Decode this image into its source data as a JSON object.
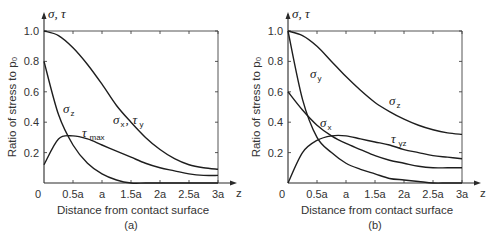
{
  "chart_data": [
    {
      "type": "line",
      "panel_label": "(a)",
      "title": "",
      "xlabel": "Distance from contact surface",
      "ylabel": "Ratio of stress to p₀",
      "y_axis_symbol": "σ, τ",
      "x_axis_symbol": "z",
      "xlim": [
        0,
        3
      ],
      "ylim": [
        0,
        1.0
      ],
      "x_tick_labels": [
        "0",
        "0.5a",
        "a",
        "1.5a",
        "2a",
        "2.5a",
        "3a"
      ],
      "y_tick_labels": [
        "0.2",
        "0.4",
        "0.6",
        "0.8",
        "1.0"
      ],
      "grid": false,
      "x": [
        0,
        0.25,
        0.5,
        0.75,
        1.0,
        1.25,
        1.5,
        1.75,
        2.0,
        2.25,
        2.5,
        2.75,
        3.0
      ],
      "series": [
        {
          "name": "σz",
          "label_main": "σ",
          "label_sub": "z",
          "values": [
            1.0,
            0.97,
            0.89,
            0.78,
            0.65,
            0.51,
            0.4,
            0.3,
            0.22,
            0.16,
            0.12,
            0.1,
            0.09
          ]
        },
        {
          "name": "σx, τy",
          "label_main": "σ",
          "label_sub": "x",
          "label_main2": "τ",
          "label_sub2": "y",
          "values": [
            0.8,
            0.45,
            0.25,
            0.13,
            0.06,
            0.02,
            0.0,
            0.0,
            0.0,
            0.0,
            0.0,
            0.0,
            0.0
          ]
        },
        {
          "name": "τmax",
          "label_main": "τ",
          "label_sub": "max",
          "values": [
            0.12,
            0.29,
            0.31,
            0.29,
            0.25,
            0.21,
            0.17,
            0.13,
            0.1,
            0.08,
            0.06,
            0.05,
            0.05
          ]
        }
      ]
    },
    {
      "type": "line",
      "panel_label": "(b)",
      "title": "",
      "xlabel": "Distance from contact surface",
      "ylabel": "Ratio of stress to p₀",
      "y_axis_symbol": "σ, τ",
      "x_axis_symbol": "z",
      "xlim": [
        0,
        3
      ],
      "ylim": [
        0,
        1.0
      ],
      "x_tick_labels": [
        "0",
        "0.5a",
        "a",
        "1.5a",
        "2a",
        "2.5a",
        "3a"
      ],
      "y_tick_labels": [
        "0.2",
        "0.4",
        "0.6",
        "0.8",
        "1.0"
      ],
      "grid": false,
      "x": [
        0,
        0.25,
        0.5,
        0.75,
        1.0,
        1.25,
        1.5,
        1.75,
        2.0,
        2.25,
        2.5,
        2.75,
        3.0
      ],
      "series": [
        {
          "name": "σz",
          "label_main": "σ",
          "label_sub": "z",
          "values": [
            1.0,
            0.97,
            0.9,
            0.8,
            0.7,
            0.61,
            0.53,
            0.47,
            0.42,
            0.38,
            0.35,
            0.33,
            0.32
          ]
        },
        {
          "name": "σy",
          "label_main": "σ",
          "label_sub": "y",
          "values": [
            1.0,
            0.55,
            0.3,
            0.2,
            0.13,
            0.09,
            0.06,
            0.03,
            0.02,
            0.01,
            0.0,
            0.0,
            0.0
          ]
        },
        {
          "name": "σx",
          "label_main": "σ",
          "label_sub": "x",
          "values": [
            0.6,
            0.48,
            0.38,
            0.31,
            0.26,
            0.22,
            0.18,
            0.15,
            0.13,
            0.11,
            0.1,
            0.1,
            0.1
          ]
        },
        {
          "name": "τyz",
          "label_main": "τ",
          "label_sub": "yz",
          "values": [
            0.0,
            0.2,
            0.28,
            0.31,
            0.31,
            0.29,
            0.27,
            0.25,
            0.22,
            0.2,
            0.18,
            0.17,
            0.16
          ]
        }
      ]
    }
  ]
}
